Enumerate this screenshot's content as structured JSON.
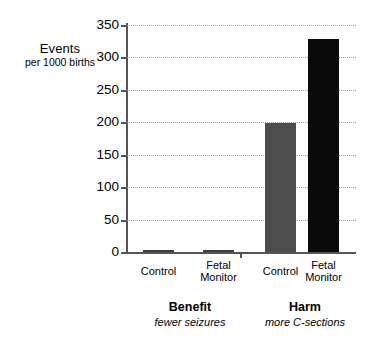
{
  "chart_data": {
    "type": "bar",
    "title": "",
    "subtitle": "",
    "xlabel": "",
    "ylabel": "Events per 1000 births",
    "ylabel_line1": "Events",
    "ylabel_line2": "per 1000 births",
    "ylim": [
      0,
      350
    ],
    "ytick_step": 50,
    "ytick_labels": [
      "0",
      "50",
      "100",
      "150",
      "200",
      "250",
      "300",
      "350"
    ],
    "ytick_values": [
      0,
      50,
      100,
      150,
      200,
      250,
      300,
      350
    ],
    "grid": true,
    "grid_style": "dotted-horizontal",
    "legend": "none",
    "categories": [
      "Control",
      "Fetal Monitor",
      "Control",
      "Fetal Monitor"
    ],
    "values": [
      2,
      2,
      199,
      328
    ],
    "bars": [
      {
        "group": "Benefit",
        "category": "Control",
        "label_line1": "Control",
        "label_line2": "",
        "value": 2,
        "color": "#3d3d3d"
      },
      {
        "group": "Benefit",
        "category": "Fetal Monitor",
        "label_line1": "Fetal",
        "label_line2": "Monitor",
        "value": 2,
        "color": "#3d3d3d"
      },
      {
        "group": "Harm",
        "category": "Control",
        "label_line1": "Control",
        "label_line2": "",
        "value": 199,
        "color": "#4d4d4d"
      },
      {
        "group": "Harm",
        "category": "Fetal Monitor",
        "label_line1": "Fetal",
        "label_line2": "Monitor",
        "value": 328,
        "color": "#0a0a0a"
      }
    ],
    "groups": [
      {
        "title": "Benefit",
        "subtitle": "fewer seizures"
      },
      {
        "title": "Harm",
        "subtitle": "more C-sections"
      }
    ],
    "colors": {
      "gray_bar": "#4d4d4d",
      "black_bar": "#0a0a0a",
      "axis": "#555555",
      "gridline": "#9b9b9b",
      "background": "#ffffff"
    }
  }
}
